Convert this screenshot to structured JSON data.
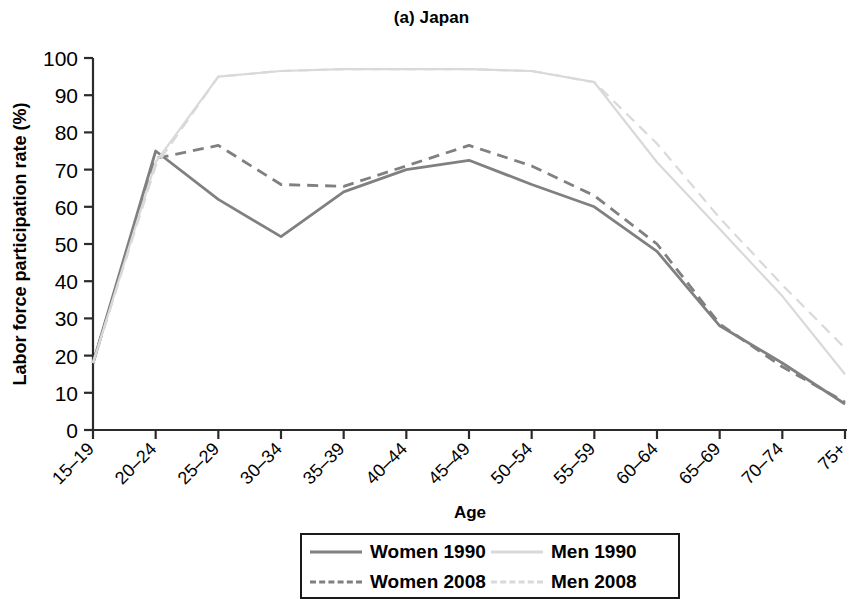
{
  "chart_data": {
    "type": "line",
    "title": "(a) Japan",
    "xlabel": "Age",
    "ylabel": "Labor force participation rate (%)",
    "categories": [
      "15–19",
      "20–24",
      "25–29",
      "30–34",
      "35–39",
      "40–44",
      "45–49",
      "50–54",
      "55–59",
      "60–64",
      "65–69",
      "70–74",
      "75+"
    ],
    "ylim": [
      0,
      100
    ],
    "yticks": [
      0,
      10,
      20,
      30,
      40,
      50,
      60,
      70,
      80,
      90,
      100
    ],
    "grid": false,
    "legend_position": "bottom",
    "series": [
      {
        "name": "Women 1990",
        "color": "#808080",
        "style": "solid",
        "values": [
          18,
          75,
          62,
          52,
          64,
          70,
          72.5,
          66,
          60,
          48,
          28,
          18,
          7
        ]
      },
      {
        "name": "Women 2008",
        "color": "#808080",
        "style": "dashed",
        "values": [
          18,
          73,
          76.5,
          66,
          65.5,
          71,
          76.5,
          71,
          63,
          50,
          28.5,
          17,
          7.5
        ]
      },
      {
        "name": "Men 1990",
        "color": "#d9d9d9",
        "style": "solid",
        "values": [
          18,
          72,
          95,
          96.5,
          97,
          97,
          97,
          96.5,
          93.5,
          72,
          54,
          36,
          15
        ]
      },
      {
        "name": "Men 2008",
        "color": "#d9d9d9",
        "style": "dashed",
        "values": [
          18,
          71,
          95,
          96.5,
          97,
          97,
          97,
          96.5,
          93.5,
          77,
          57,
          39,
          22
        ]
      }
    ]
  },
  "legend": {
    "entries": [
      {
        "label": "Women 1990"
      },
      {
        "label": "Men 1990"
      },
      {
        "label": "Women 2008"
      },
      {
        "label": "Men 2008"
      }
    ]
  }
}
